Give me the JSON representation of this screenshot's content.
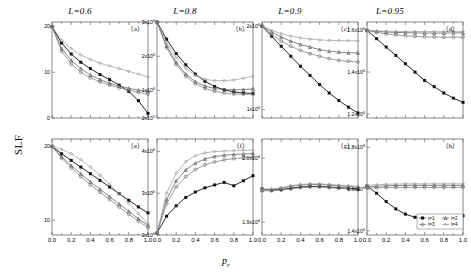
{
  "figure": {
    "ylabel": "SLF",
    "xlabel_base": "p",
    "xlabel_sub": "r",
    "column_titles": [
      {
        "prefix": "L",
        "eq": "=0.6"
      },
      {
        "prefix": "L",
        "eq": "=0.8"
      },
      {
        "prefix": "L",
        "eq": "=0.9"
      },
      {
        "prefix": "L",
        "eq": "=0.95"
      }
    ],
    "legend": {
      "entries": [
        "t=1",
        "t=2",
        "t=3",
        "t=4"
      ],
      "position": "bottom-right-panel-h"
    },
    "x_ticklabels": [
      "0.0",
      "0.2",
      "0.4",
      "0.6",
      "0.8",
      "1.0"
    ],
    "series_colors": [
      "#111111",
      "#555555",
      "#777777",
      "#999999"
    ]
  },
  "chart_data": [
    {
      "type": "line",
      "panel": "(a)",
      "title": "L=0.6",
      "xlabel": "p_r",
      "ylabel": "SLF",
      "xlim": [
        0,
        1
      ],
      "ylim": [
        0,
        21
      ],
      "x": [
        0.0,
        0.1,
        0.2,
        0.3,
        0.4,
        0.5,
        0.6,
        0.7,
        0.8,
        0.9,
        1.0
      ],
      "yticks": [
        0,
        10,
        20
      ],
      "ytick_labels": [
        "0",
        "10",
        "20"
      ],
      "grid": false,
      "series": [
        {
          "name": "t=1",
          "values": [
            20.0,
            16.4,
            14.0,
            12.2,
            10.8,
            9.5,
            8.4,
            7.2,
            5.8,
            3.8,
            1.0
          ]
        },
        {
          "name": "t=2",
          "values": [
            20.0,
            15.2,
            12.6,
            10.8,
            9.4,
            8.4,
            7.6,
            7.0,
            6.5,
            6.1,
            5.8
          ]
        },
        {
          "name": "t=3",
          "values": [
            20.0,
            14.6,
            11.8,
            10.0,
            8.8,
            7.9,
            7.2,
            6.6,
            6.1,
            5.6,
            5.2
          ]
        },
        {
          "name": "t=4",
          "values": [
            20.0,
            17.0,
            15.2,
            13.8,
            12.8,
            12.0,
            11.4,
            10.8,
            10.2,
            9.6,
            9.0
          ]
        }
      ]
    },
    {
      "type": "line",
      "panel": "(b)",
      "title": "L=0.8",
      "xlabel": "p_r",
      "ylabel": "SLF",
      "xlim": [
        0,
        1
      ],
      "ylim": [
        200000,
        3000000
      ],
      "x": [
        0.0,
        0.1,
        0.2,
        0.3,
        0.4,
        0.5,
        0.6,
        0.7,
        0.8,
        0.9,
        1.0
      ],
      "yticks": [
        200000,
        1000000,
        2000000,
        3000000
      ],
      "ytick_labels": [
        "2x10^5",
        "1x10^6",
        "2x10^6",
        "3x10^6"
      ],
      "grid": false,
      "series": [
        {
          "name": "t=1",
          "values": [
            3000000,
            2500000,
            2080000,
            1750000,
            1480000,
            1270000,
            1120000,
            1020000,
            960000,
            930000,
            920000
          ]
        },
        {
          "name": "t=2",
          "values": [
            3000000,
            2300000,
            1820000,
            1480000,
            1260000,
            1130000,
            1060000,
            1030000,
            1020000,
            1030000,
            1050000
          ]
        },
        {
          "name": "t=3",
          "values": [
            3000000,
            2250000,
            1760000,
            1420000,
            1200000,
            1060000,
            980000,
            930000,
            900000,
            890000,
            890000
          ]
        },
        {
          "name": "t=4",
          "values": [
            3000000,
            2400000,
            1960000,
            1650000,
            1440000,
            1330000,
            1290000,
            1290000,
            1310000,
            1360000,
            1420000
          ]
        }
      ]
    },
    {
      "type": "line",
      "panel": "(c)",
      "title": "L=0.9",
      "xlabel": "p_r",
      "ylabel": "SLF",
      "xlim": [
        0,
        1
      ],
      "ylim": [
        900000,
        2050000
      ],
      "x": [
        0.0,
        0.1,
        0.2,
        0.3,
        0.4,
        0.5,
        0.6,
        0.7,
        0.8,
        0.9,
        1.0
      ],
      "yticks": [
        1000000,
        2000000
      ],
      "ytick_labels": [
        "1x10^6",
        "2x10^6"
      ],
      "grid": false,
      "series": [
        {
          "name": "t=1",
          "values": [
            2000000,
            1880000,
            1760000,
            1640000,
            1520000,
            1410000,
            1300000,
            1200000,
            1110000,
            1030000,
            960000
          ]
        },
        {
          "name": "t=2",
          "values": [
            2000000,
            1930000,
            1870000,
            1820000,
            1780000,
            1750000,
            1720000,
            1700000,
            1690000,
            1680000,
            1680000
          ]
        },
        {
          "name": "t=3",
          "values": [
            2000000,
            1900000,
            1820000,
            1760000,
            1710000,
            1670000,
            1640000,
            1610000,
            1590000,
            1580000,
            1570000
          ]
        },
        {
          "name": "t=4",
          "values": [
            2000000,
            1950000,
            1910000,
            1880000,
            1860000,
            1845000,
            1835000,
            1830000,
            1828000,
            1826000,
            1825000
          ]
        }
      ]
    },
    {
      "type": "line",
      "panel": "(d)",
      "title": "L=0.95",
      "xlabel": "p_r",
      "ylabel": "SLF",
      "xlim": [
        0,
        1
      ],
      "ylim": [
        1180000,
        1640000
      ],
      "x": [
        0.0,
        0.1,
        0.2,
        0.3,
        0.4,
        0.5,
        0.6,
        0.7,
        0.8,
        0.9,
        1.0
      ],
      "yticks": [
        1200000,
        1400000,
        1600000
      ],
      "ytick_labels": [
        "1.2x10^6",
        "1.4x10^6",
        "1.6x10^6"
      ],
      "grid": false,
      "series": [
        {
          "name": "t=1",
          "values": [
            1600000,
            1560000,
            1520000,
            1480000,
            1440000,
            1400000,
            1360000,
            1330000,
            1300000,
            1275000,
            1255000
          ]
        },
        {
          "name": "t=2",
          "values": [
            1600000,
            1595000,
            1592000,
            1590000,
            1589000,
            1588000,
            1587000,
            1587000,
            1587000,
            1588000,
            1588000
          ]
        },
        {
          "name": "t=3",
          "values": [
            1600000,
            1590000,
            1583000,
            1578000,
            1574000,
            1571000,
            1569000,
            1568000,
            1567000,
            1567000,
            1567000
          ]
        },
        {
          "name": "t=4",
          "values": [
            1600000,
            1597000,
            1596000,
            1595000,
            1594000,
            1594000,
            1594000,
            1594000,
            1594000,
            1595000,
            1595000
          ]
        }
      ]
    },
    {
      "type": "line",
      "panel": "(e)",
      "title": "L=0.6",
      "xlabel": "p_r",
      "ylabel": "SLF",
      "xlim": [
        0,
        1
      ],
      "ylim": [
        8,
        21
      ],
      "x": [
        0.0,
        0.1,
        0.2,
        0.3,
        0.4,
        0.5,
        0.6,
        0.7,
        0.8,
        0.9,
        1.0
      ],
      "yticks": [
        10,
        20
      ],
      "ytick_labels": [
        "10",
        "20"
      ],
      "grid": false,
      "series": [
        {
          "name": "t=1",
          "values": [
            20.0,
            19.0,
            18.1,
            17.2,
            16.3,
            15.4,
            14.5,
            13.6,
            12.7,
            11.8,
            11.0
          ]
        },
        {
          "name": "t=2",
          "values": [
            20.0,
            18.6,
            17.4,
            16.3,
            15.2,
            14.2,
            13.2,
            12.2,
            11.2,
            10.2,
            9.3
          ]
        },
        {
          "name": "t=3",
          "values": [
            20.0,
            18.4,
            17.1,
            15.9,
            14.8,
            13.8,
            12.8,
            11.8,
            10.8,
            9.9,
            9.0
          ]
        },
        {
          "name": "t=4",
          "values": [
            20.0,
            19.6,
            19.0,
            18.2,
            17.2,
            16.1,
            14.9,
            13.6,
            12.3,
            10.9,
            9.5
          ]
        }
      ]
    },
    {
      "type": "line",
      "panel": "(f)",
      "title": "L=0.8",
      "xlabel": "p_r",
      "ylabel": "SLF",
      "xlim": [
        0,
        1
      ],
      "ylim": [
        2000000,
        4300000
      ],
      "x": [
        0.0,
        0.1,
        0.2,
        0.3,
        0.4,
        0.5,
        0.6,
        0.7,
        0.8,
        0.9,
        1.0
      ],
      "yticks": [
        2000000,
        3000000,
        4000000
      ],
      "ytick_labels": [
        "2x10^6",
        "3x10^6",
        "4x10^6"
      ],
      "grid": false,
      "series": [
        {
          "name": "t=1",
          "values": [
            2050000,
            2450000,
            2700000,
            2900000,
            3030000,
            3130000,
            3200000,
            3260000,
            3180000,
            3300000,
            3420000
          ]
        },
        {
          "name": "t=2",
          "values": [
            2050000,
            2850000,
            3300000,
            3560000,
            3720000,
            3820000,
            3880000,
            3910000,
            3930000,
            3940000,
            3950000
          ]
        },
        {
          "name": "t=3",
          "values": [
            2050000,
            2750000,
            3150000,
            3400000,
            3570000,
            3680000,
            3750000,
            3800000,
            3830000,
            3850000,
            3860000
          ]
        },
        {
          "name": "t=4",
          "values": [
            2050000,
            3000000,
            3480000,
            3760000,
            3900000,
            3970000,
            4000000,
            4010000,
            4020000,
            4030000,
            4030000
          ]
        }
      ]
    },
    {
      "type": "line",
      "panel": "(g)",
      "title": "L=0.9",
      "xlabel": "p_r",
      "ylabel": "SLF",
      "xlim": [
        0,
        1
      ],
      "ylim": [
        1880000,
        2030000
      ],
      "x": [
        0.0,
        0.1,
        0.2,
        0.3,
        0.4,
        0.5,
        0.6,
        0.7,
        0.8,
        0.9,
        1.0
      ],
      "yticks": [
        1900000,
        2000000
      ],
      "ytick_labels": [
        "1.9x10^6",
        "2.0x10^6"
      ],
      "grid": false,
      "series": [
        {
          "name": "t=1",
          "values": [
            1952000,
            1950000,
            1951000,
            1953000,
            1955000,
            1956000,
            1956000,
            1955000,
            1954000,
            1953000,
            1952000
          ]
        },
        {
          "name": "t=2",
          "values": [
            1950000,
            1951000,
            1953000,
            1956000,
            1958000,
            1959000,
            1959000,
            1958000,
            1957000,
            1956000,
            1955000
          ]
        },
        {
          "name": "t=3",
          "values": [
            1949000,
            1949000,
            1950000,
            1952000,
            1954000,
            1955000,
            1955000,
            1954000,
            1953000,
            1952000,
            1951000
          ]
        },
        {
          "name": "t=4",
          "values": [
            1951000,
            1952000,
            1954000,
            1957000,
            1959000,
            1960000,
            1960000,
            1959000,
            1958000,
            1957000,
            1956000
          ]
        }
      ]
    },
    {
      "type": "line",
      "panel": "(h)",
      "title": "L=0.95",
      "xlabel": "p_r",
      "ylabel": "SLF",
      "xlim": [
        0,
        1
      ],
      "ylim": [
        1380000,
        1840000
      ],
      "x": [
        0.0,
        0.1,
        0.2,
        0.3,
        0.4,
        0.5,
        0.6,
        0.7,
        0.8,
        0.9,
        1.0
      ],
      "yticks": [
        1400000,
        1600000,
        1800000
      ],
      "ytick_labels": [
        "1.4x10^6",
        "1.6x10^6",
        "1.8x10^6"
      ],
      "grid": false,
      "series": [
        {
          "name": "t=1",
          "values": [
            1615000,
            1580000,
            1540000,
            1505000,
            1480000,
            1465000,
            1460000,
            1463000,
            1468000,
            1470000,
            1472000
          ]
        },
        {
          "name": "t=2",
          "values": [
            1612000,
            1614000,
            1616000,
            1617000,
            1618000,
            1618000,
            1618000,
            1618000,
            1618000,
            1618000,
            1618000
          ]
        },
        {
          "name": "t=3",
          "values": [
            1605000,
            1606000,
            1607000,
            1608000,
            1608000,
            1608000,
            1608000,
            1608000,
            1608000,
            1608000,
            1608000
          ]
        },
        {
          "name": "t=4",
          "values": [
            1618000,
            1621000,
            1623000,
            1624000,
            1625000,
            1625000,
            1625000,
            1625000,
            1625000,
            1625000,
            1625000
          ]
        }
      ]
    }
  ]
}
